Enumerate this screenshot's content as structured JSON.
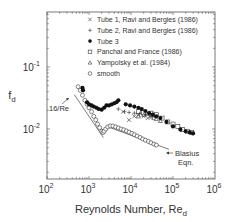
{
  "chart_data": {
    "type": "scatter",
    "title": "",
    "xlabel": "Reynolds Number, Re",
    "xlabel_sub": "d",
    "ylabel": "f",
    "ylabel_sub": "d",
    "xscale": "log",
    "yscale": "log",
    "xlim": [
      100,
      1000000
    ],
    "ylim": [
      0.0016,
      0.11
    ],
    "grid": false,
    "legend_position": "upper right (inside)",
    "x_ticks": [
      {
        "value": 100,
        "base": "10",
        "exp": "2"
      },
      {
        "value": 1000,
        "base": "10",
        "exp": "3"
      },
      {
        "value": 10000,
        "base": "10",
        "exp": "4"
      },
      {
        "value": 100000,
        "base": "10",
        "exp": "5"
      },
      {
        "value": 1000000,
        "base": "10",
        "exp": "6"
      }
    ],
    "y_ticks": [
      {
        "value": 0.1,
        "base": "10",
        "exp": "-1"
      },
      {
        "value": 0.01,
        "base": "10",
        "exp": "-2"
      }
    ],
    "annotations": [
      {
        "text": "16/Re",
        "x": 700,
        "y": 0.03
      },
      {
        "text": "Blasius",
        "text2": "Eqn.",
        "x": 100000,
        "y": 0.0065
      }
    ],
    "lines": [
      {
        "name": "16/Re",
        "points": [
          [
            450,
            0.0356
          ],
          [
            2200,
            0.00727
          ]
        ]
      },
      {
        "name": "Blasius Eqn.",
        "points": [
          [
            3000,
            0.0107
          ],
          [
            80000,
            0.0047
          ]
        ]
      }
    ],
    "series": [
      {
        "name": "Tube 1, Ravi and Bergles (1986)",
        "marker": "x",
        "points": [
          [
            6500,
            0.019
          ],
          [
            9000,
            0.014
          ],
          [
            12000,
            0.016
          ],
          [
            15000,
            0.017
          ],
          [
            20000,
            0.016
          ],
          [
            25000,
            0.015
          ]
        ]
      },
      {
        "name": "Tube 2, Ravi and Bergles (1986)",
        "marker": "+",
        "points": [
          [
            5000,
            0.021
          ],
          [
            7000,
            0.019
          ],
          [
            9000,
            0.0185
          ],
          [
            12000,
            0.018
          ],
          [
            16000,
            0.0175
          ],
          [
            22000,
            0.017
          ],
          [
            30000,
            0.016
          ]
        ]
      },
      {
        "name": "Tube 3",
        "marker": "filled-circle",
        "points": [
          [
            700,
            0.046
          ],
          [
            720,
            0.042
          ],
          [
            900,
            0.027
          ],
          [
            1000,
            0.025
          ],
          [
            1150,
            0.024
          ],
          [
            1300,
            0.023
          ],
          [
            1500,
            0.022
          ],
          [
            1700,
            0.021
          ],
          [
            2000,
            0.0205
          ],
          [
            2300,
            0.022
          ],
          [
            2600,
            0.024
          ],
          [
            3000,
            0.024
          ],
          [
            3500,
            0.025
          ],
          [
            4000,
            0.026
          ],
          [
            4500,
            0.027
          ],
          [
            5000,
            0.029
          ],
          [
            7500,
            0.025
          ],
          [
            9500,
            0.024
          ],
          [
            12000,
            0.023
          ],
          [
            15000,
            0.022
          ],
          [
            18000,
            0.021
          ],
          [
            22000,
            0.0195
          ],
          [
            27000,
            0.018
          ],
          [
            33000,
            0.017
          ],
          [
            40000,
            0.016
          ],
          [
            50000,
            0.015
          ],
          [
            70000,
            0.013
          ],
          [
            100000,
            0.011
          ],
          [
            150000,
            0.0098
          ],
          [
            200000,
            0.0092
          ],
          [
            250000,
            0.0088
          ],
          [
            300000,
            0.0085
          ]
        ]
      },
      {
        "name": "Panchal and France (1986)",
        "marker": "open-square",
        "points": [
          [
            15000,
            0.019
          ],
          [
            20000,
            0.0185
          ],
          [
            30000,
            0.018
          ],
          [
            40000,
            0.017
          ],
          [
            55000,
            0.015
          ],
          [
            75000,
            0.013
          ],
          [
            100000,
            0.012
          ],
          [
            130000,
            0.011
          ],
          [
            170000,
            0.0098
          ],
          [
            220000,
            0.0092
          ],
          [
            280000,
            0.0088
          ]
        ]
      },
      {
        "name": "Yampolsky et al. (1984)",
        "marker": "open-triangle",
        "points": [
          [
            15000,
            0.016
          ],
          [
            20000,
            0.017
          ],
          [
            25000,
            0.0175
          ],
          [
            30000,
            0.016
          ],
          [
            35000,
            0.015
          ],
          [
            40000,
            0.0145
          ],
          [
            50000,
            0.0135
          ]
        ]
      },
      {
        "name": "smooth",
        "marker": "open-circle",
        "points": [
          [
            550,
            0.048
          ],
          [
            620,
            0.042
          ],
          [
            700,
            0.035
          ],
          [
            800,
            0.029
          ],
          [
            900,
            0.025
          ],
          [
            1000,
            0.022
          ],
          [
            1150,
            0.019
          ],
          [
            1300,
            0.016
          ],
          [
            1450,
            0.014
          ],
          [
            1600,
            0.012
          ],
          [
            1800,
            0.0105
          ],
          [
            2000,
            0.0092
          ],
          [
            2150,
            0.0088
          ],
          [
            2300,
            0.0092
          ],
          [
            2500,
            0.01
          ],
          [
            2800,
            0.0108
          ],
          [
            3200,
            0.0112
          ],
          [
            3700,
            0.0112
          ],
          [
            4300,
            0.0108
          ],
          [
            5000,
            0.0104
          ],
          [
            5800,
            0.01
          ],
          [
            6700,
            0.0097
          ],
          [
            7800,
            0.0093
          ],
          [
            9000,
            0.0089
          ],
          [
            10500,
            0.0085
          ],
          [
            12000,
            0.0081
          ],
          [
            14000,
            0.0077
          ],
          [
            16500,
            0.0073
          ],
          [
            19000,
            0.0069
          ],
          [
            22000,
            0.0066
          ],
          [
            26000,
            0.0063
          ],
          [
            30000,
            0.006
          ],
          [
            35000,
            0.0057
          ],
          [
            40000,
            0.0055
          ]
        ]
      }
    ]
  }
}
